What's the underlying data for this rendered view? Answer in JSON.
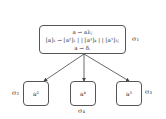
{
  "parent": {
    "label": "σ₁",
    "rules": [
      "a → aλ;",
      "[a]₁ → [a²]₂ | | [a⁴]₄ | | [a³]₃;",
      "a → δ."
    ]
  },
  "children": [
    {
      "content": "a²",
      "label": "σ₂"
    },
    {
      "content": "a⁴",
      "label": "σ₄"
    },
    {
      "content": "a³",
      "label": "σ₃"
    }
  ]
}
